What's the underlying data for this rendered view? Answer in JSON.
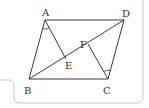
{
  "figure": {
    "type": "parallelogram-geometry",
    "colors": {
      "line": "#3a3a3a",
      "frame": "#c8c8c8",
      "label": "#333333",
      "background": "#ffffff"
    },
    "points": {
      "A": {
        "label": "A",
        "x": 45,
        "y": 20,
        "lx": 46,
        "ly": 16
      },
      "D": {
        "label": "D",
        "x": 124,
        "y": 20,
        "lx": 126,
        "ly": 17
      },
      "B": {
        "label": "B",
        "x": 29,
        "y": 79,
        "lx": 28,
        "ly": 94
      },
      "C": {
        "label": "C",
        "x": 108,
        "y": 79,
        "lx": 107,
        "ly": 94
      },
      "E": {
        "label": "E",
        "x": 66,
        "y": 59,
        "lx": 69,
        "ly": 69
      },
      "F": {
        "label": "F",
        "x": 88,
        "y": 44,
        "lx": 84,
        "ly": 48
      }
    },
    "segments": [
      {
        "from": "A",
        "to": "D"
      },
      {
        "from": "D",
        "to": "C"
      },
      {
        "from": "C",
        "to": "B"
      },
      {
        "from": "B",
        "to": "A"
      },
      {
        "from": "B",
        "to": "D"
      },
      {
        "from": "A",
        "to": "E"
      },
      {
        "from": "C",
        "to": "F"
      }
    ],
    "angle_marks": [
      {
        "vertex": "A",
        "note": "angle BAE"
      },
      {
        "vertex": "C",
        "note": "angle DCF"
      }
    ]
  }
}
